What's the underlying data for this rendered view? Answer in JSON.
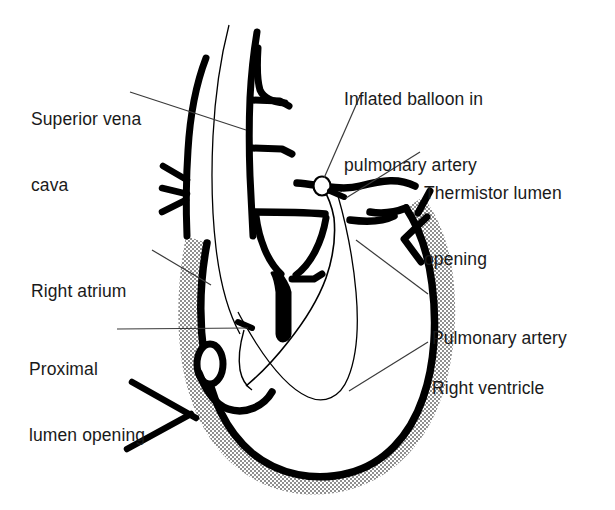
{
  "figure": {
    "kind": "anatomical-line-diagram",
    "background_color": "#ffffff",
    "ink_color": "#000000",
    "myocardium_fill_color": "#a9a9a9",
    "chamber_fill_color": "#ffffff",
    "leader_line_color": "#3a3a3a",
    "width": 615,
    "height": 510
  },
  "labels": {
    "superior_vena_cava": {
      "line1": "Superior vena",
      "line2": "cava"
    },
    "inflated_balloon": {
      "line1": "Inflated balloon in",
      "line2": "pulmonary artery"
    },
    "thermistor_lumen": {
      "line1": "Thermistor lumen",
      "line2": "opening"
    },
    "right_atrium": {
      "line1": "Right atrium"
    },
    "proximal_lumen": {
      "line1": "Proximal",
      "line2": "lumen opening"
    },
    "pulmonary_artery": {
      "line1": "Pulmonary artery"
    },
    "right_ventricle": {
      "line1": "Right ventricle"
    }
  },
  "callouts": [
    {
      "name": "superior-vena-cava",
      "anchor_x": 246,
      "anchor_y": 130
    },
    {
      "name": "inflated-balloon",
      "anchor_x": 322,
      "anchor_y": 185
    },
    {
      "name": "thermistor-lumen",
      "anchor_x": 344,
      "anchor_y": 196
    },
    {
      "name": "right-atrium",
      "anchor_x": 209,
      "anchor_y": 283
    },
    {
      "name": "proximal-lumen",
      "anchor_x": 248,
      "anchor_y": 327
    },
    {
      "name": "pulmonary-artery",
      "anchor_x": 356,
      "anchor_y": 239
    },
    {
      "name": "right-ventricle",
      "anchor_x": 348,
      "anchor_y": 392
    }
  ],
  "markers": {
    "balloon": {
      "cx": 322,
      "cy": 186,
      "rx": 8,
      "ry": 9
    },
    "thermistor_opening": {
      "x": 338,
      "y": 193
    },
    "proximal_opening": {
      "x": 246,
      "y": 325
    }
  }
}
